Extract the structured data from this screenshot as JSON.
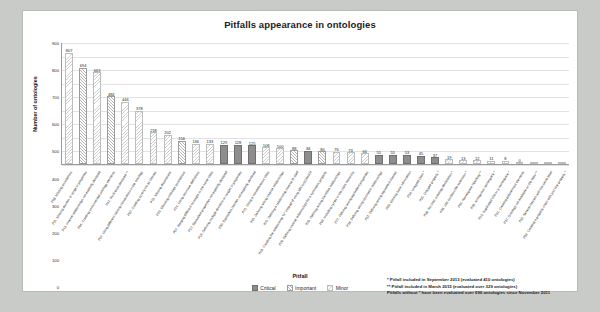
{
  "chart_data": {
    "type": "bar",
    "title": "Pitfalls appearance in ontologies",
    "xlabel": "Pitfall",
    "ylabel": "Number of ontologies",
    "ylim": [
      0,
      900
    ],
    "yticks": [
      0,
      100,
      200,
      300,
      400,
      500,
      600,
      700,
      800,
      900
    ],
    "grid": true,
    "legend_position": "bottom-center",
    "legend": [
      "Critical",
      "Important",
      "Minor"
    ],
    "categories": [
      "P08. Missing annotations",
      "P11. Missing domain or range in properties",
      "P13. Inverse relationships not explicitly declared",
      "P04. Creating unconnected ontology elements",
      "P41. No license declared **",
      "P22. Using different naming conventions in the ontology",
      "P02. Creating synonyms as classes",
      "P10. Missing disjointness",
      "P20. Misusing ontology annotations",
      "P24. Using recursive definitions",
      "P07. Merging different concepts in the same class",
      "P12. Equivalent properties not explicitly declared",
      "P19. Defining multiple domains or ranges in properties",
      "P30. Equivalent classes not explicitly declared",
      "P21. Using a miscellaneous class",
      "P05. Defining wrong inverse relationships",
      "P25. Defining a relationship inverse to itself",
      "P03. Creating the relationship \"is\" instead of using rdfs:subClassOf",
      "P26. Defining inverse relationships for a symmetric property",
      "P29. Defining wrong transitive relationships",
      "P06. Including cycles in the class hierarchy",
      "P27. Defining wrong equivalent properties",
      "P28. Defining wrong symmetric relationships",
      "P31. Defining wrong equivalent classes",
      "P09. Missing basic information",
      "P34. Untyped class *",
      "P35. Untyped property *",
      "P38. No OWL ontology declaration *",
      "P36. URI contains file extension *",
      "P40. Namespace hijacking **",
      "P39. Ambiguous namespace *",
      "P23. Duplicated URI or a namespace *",
      "P01. Creating polysemous elements",
      "P37. Ontology not available on the Web **",
      "P32. Several classes with the same label",
      "P33. Creating a property chain with just one property *"
    ],
    "values": [
      807,
      694,
      663,
      484,
      446,
      378,
      218,
      202,
      156,
      136,
      133,
      129,
      128,
      125,
      108,
      100,
      88,
      84,
      80,
      76,
      73,
      66,
      55,
      55,
      53,
      45,
      37,
      19,
      13,
      12,
      11,
      8,
      0,
      0,
      0,
      0
    ],
    "severity": [
      "minor",
      "important",
      "minor",
      "important",
      "minor",
      "minor",
      "minor",
      "minor",
      "important",
      "minor",
      "minor",
      "critical",
      "critical",
      "critical",
      "minor",
      "minor",
      "important",
      "critical",
      "important",
      "minor",
      "minor",
      "minor",
      "critical",
      "critical",
      "critical",
      "critical",
      "critical",
      "minor",
      "minor",
      "minor",
      "minor",
      "minor",
      "minor",
      "minor",
      "minor",
      "minor"
    ],
    "value_labels": [
      "807",
      "694",
      "663",
      "484",
      "446",
      "378",
      "218",
      "202",
      "156",
      "136",
      "133",
      "129",
      "128",
      "125",
      "108",
      "100",
      "88",
      "84",
      "80",
      "76",
      "73",
      "66",
      "55",
      "55",
      "53",
      "45",
      "37",
      "19",
      "13",
      "12",
      "11",
      "8",
      "0",
      "",
      "",
      ""
    ]
  },
  "notes": [
    "* Pitfall included in September 2013 (evaluated 410 ontologies)",
    "** Pitfall included in March 2015 (evaluated over 329 ontologies)",
    "Pitfalls without * have been evaluated over 696 ontologies since November 2011"
  ]
}
